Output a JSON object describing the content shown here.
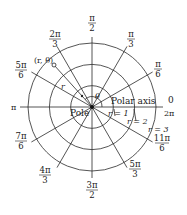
{
  "diagram": {
    "center": {
      "x": 92,
      "y": 107
    },
    "unit_radius_px": 21.3,
    "circles": [
      {
        "label": "r = 1",
        "r": 1
      },
      {
        "label": "r = 2",
        "r": 2
      },
      {
        "label": "r = 3",
        "r": 3
      }
    ],
    "angle_labels": [
      {
        "id": "0",
        "num": "0",
        "den": ""
      },
      {
        "id": "pi_6",
        "num": "π",
        "den": "6"
      },
      {
        "id": "pi_3",
        "num": "π",
        "den": "3"
      },
      {
        "id": "pi_2",
        "num": "π",
        "den": "2"
      },
      {
        "id": "2pi_3",
        "num": "2π",
        "den": "3"
      },
      {
        "id": "5pi_6",
        "num": "5π",
        "den": "6"
      },
      {
        "id": "pi",
        "num": "π",
        "den": ""
      },
      {
        "id": "7pi_6",
        "num": "7π",
        "den": "6"
      },
      {
        "id": "4pi_3",
        "num": "4π",
        "den": "3"
      },
      {
        "id": "3pi_2",
        "num": "3π",
        "den": "2"
      },
      {
        "id": "5pi_3",
        "num": "5π",
        "den": "3"
      },
      {
        "id": "11pi_6",
        "num": "11π",
        "den": "6"
      },
      {
        "id": "2pi",
        "num": "2π",
        "den": ""
      }
    ],
    "annotations": {
      "point": "(r, θ)",
      "radius": "r",
      "angle": "θ",
      "polar_axis": "Polar axis",
      "pole": "Pole",
      "r1": "r = 1",
      "r2": "r = 2",
      "r3": "r = 3"
    }
  }
}
